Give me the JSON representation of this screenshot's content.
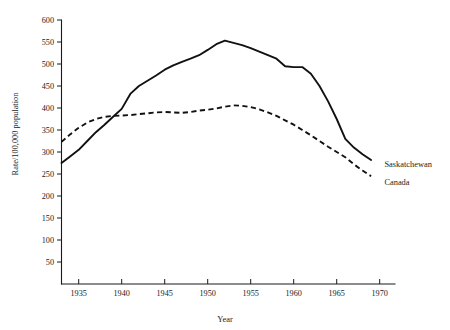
{
  "chart_data": {
    "type": "line",
    "title": "",
    "xlabel": "Year",
    "ylabel": "Rate/100,000 population",
    "xlim": [
      1933,
      1970
    ],
    "ylim": [
      0,
      600
    ],
    "grid": false,
    "legend_position": "right-inline-labels",
    "x_ticks": [
      1935,
      1940,
      1945,
      1950,
      1955,
      1960,
      1965,
      1970
    ],
    "y_ticks": [
      50,
      100,
      150,
      200,
      250,
      300,
      350,
      400,
      450,
      500,
      550,
      600
    ],
    "series": [
      {
        "name": "Saskatchewan",
        "style": "solid",
        "color": "#111111",
        "x": [
          1933,
          1934,
          1935,
          1936,
          1937,
          1938,
          1939,
          1940,
          1941,
          1942,
          1943,
          1944,
          1945,
          1946,
          1947,
          1948,
          1949,
          1950,
          1951,
          1952,
          1953,
          1954,
          1955,
          1956,
          1957,
          1958,
          1959,
          1960,
          1961,
          1962,
          1963,
          1964,
          1965,
          1966,
          1967,
          1968,
          1969
        ],
        "y": [
          275,
          290,
          305,
          325,
          345,
          362,
          380,
          398,
          432,
          450,
          462,
          474,
          487,
          497,
          505,
          512,
          520,
          532,
          545,
          553,
          548,
          543,
          536,
          528,
          520,
          512,
          495,
          493,
          493,
          478,
          450,
          415,
          375,
          330,
          310,
          295,
          282
        ]
      },
      {
        "name": "Canada",
        "style": "dashed",
        "color": "#111111",
        "x": [
          1933,
          1934,
          1935,
          1936,
          1937,
          1938,
          1939,
          1940,
          1941,
          1942,
          1943,
          1944,
          1945,
          1946,
          1947,
          1948,
          1949,
          1950,
          1951,
          1952,
          1953,
          1954,
          1955,
          1956,
          1957,
          1958,
          1959,
          1960,
          1961,
          1962,
          1963,
          1964,
          1965,
          1966,
          1967,
          1968,
          1969
        ],
        "y": [
          323,
          340,
          355,
          367,
          375,
          380,
          382,
          383,
          384,
          386,
          388,
          390,
          391,
          390,
          389,
          391,
          394,
          396,
          399,
          403,
          406,
          405,
          402,
          397,
          390,
          382,
          372,
          362,
          350,
          338,
          325,
          312,
          300,
          288,
          272,
          258,
          245
        ]
      }
    ],
    "series_labels": [
      {
        "name": "Saskatchewan",
        "at_x": 1970.2,
        "at_y": 272
      },
      {
        "name": "Canada",
        "at_x": 1970.2,
        "at_y": 232
      }
    ]
  }
}
